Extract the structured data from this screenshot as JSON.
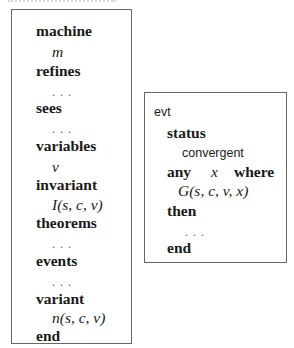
{
  "machine": {
    "lines": [
      {
        "kind": "keyword",
        "text": "machine"
      },
      {
        "kind": "math",
        "text": "m"
      },
      {
        "kind": "keyword",
        "text": "refines"
      },
      {
        "kind": "dots",
        "text": ". . ."
      },
      {
        "kind": "keyword",
        "text": "sees"
      },
      {
        "kind": "dots",
        "text": ". . ."
      },
      {
        "kind": "keyword",
        "text": "variables"
      },
      {
        "kind": "math",
        "text": "v"
      },
      {
        "kind": "keyword",
        "text": "invariant"
      },
      {
        "kind": "math",
        "text": "I(s, c, v)"
      },
      {
        "kind": "keyword",
        "text": "theorems"
      },
      {
        "kind": "dots",
        "text": ". . ."
      },
      {
        "kind": "keyword",
        "text": "events"
      },
      {
        "kind": "dots",
        "text": ". . ."
      },
      {
        "kind": "keyword",
        "text": "variant"
      },
      {
        "kind": "math",
        "text": "n(s, c, v)"
      },
      {
        "kind": "keyword",
        "text": "end"
      }
    ]
  },
  "event": {
    "name": "evt",
    "status_keyword": "status",
    "status_value": "convergent",
    "any_keyword": "any",
    "param": "x",
    "where_keyword": "where",
    "guard": "G(s, c, v, x)",
    "then_keyword": "then",
    "actions": ". . .",
    "end_keyword": "end"
  }
}
